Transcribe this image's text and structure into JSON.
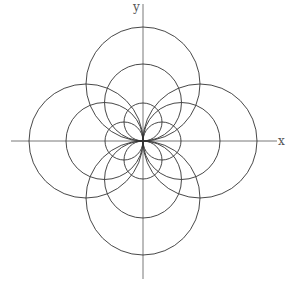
{
  "figure": {
    "axes": {
      "x_label": "x",
      "y_label": "y",
      "origin_px": [
        143,
        141
      ],
      "x_axis_px": [
        11,
        277
      ],
      "y_axis_px": [
        4,
        279
      ]
    },
    "stroke_color": "#333333",
    "axis_color": "#555555",
    "circle_radii_px": [
      19,
      38.5,
      57
    ],
    "directions": [
      "up",
      "down",
      "left",
      "right"
    ]
  }
}
